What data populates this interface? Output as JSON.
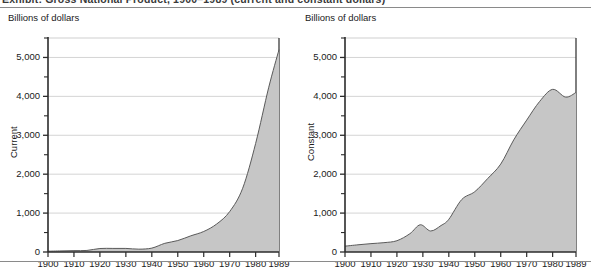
{
  "figure": {
    "title_clipped": "Exhibit: Gross National Product, 1900–1989 (current and constant dollars)",
    "colors": {
      "area_fill": "#c6c6c6",
      "area_line": "#5a5a5a",
      "axis": "#2b2b2b",
      "gridline": "#c9c9c9",
      "rule": "#8a8a8a",
      "text": "#1a1a1a"
    }
  },
  "panels": [
    {
      "id": "current",
      "unit_label": "Billions of dollars",
      "axis_title": "Current"
    },
    {
      "id": "constant",
      "unit_label": "Billions of dollars",
      "axis_title": "Constant"
    }
  ],
  "y_tick_labels": [
    "5,000",
    "4,000",
    "3,000",
    "2,000",
    "1,000",
    "0"
  ],
  "x_tick_labels": [
    "1900",
    "1910",
    "1920",
    "1930",
    "1940",
    "1950",
    "1960",
    "1970",
    "1980",
    "1989"
  ],
  "chart_data": [
    {
      "type": "area",
      "id": "current",
      "title": "Current",
      "xlabel": "",
      "ylabel": "Current",
      "unit": "Billions of dollars",
      "xlim": [
        1900,
        1989
      ],
      "ylim": [
        0,
        5500
      ],
      "yticks": [
        0,
        1000,
        2000,
        3000,
        4000,
        5000
      ],
      "yticks_minor": [
        500,
        1500,
        2500,
        3500,
        4500,
        5500
      ],
      "xticks": [
        1900,
        1910,
        1920,
        1930,
        1940,
        1950,
        1960,
        1970,
        1980,
        1989
      ],
      "grid": "horizontal",
      "legend": "none",
      "x": [
        1900,
        1905,
        1910,
        1915,
        1920,
        1925,
        1930,
        1935,
        1940,
        1945,
        1950,
        1955,
        1960,
        1965,
        1970,
        1975,
        1980,
        1985,
        1989
      ],
      "values": [
        20,
        28,
        35,
        40,
        90,
        92,
        92,
        73,
        100,
        223,
        294,
        415,
        527,
        720,
        1039,
        1638,
        2790,
        4220,
        5200
      ]
    },
    {
      "type": "area",
      "id": "constant",
      "title": "Constant",
      "xlabel": "",
      "ylabel": "Constant",
      "unit": "Billions of dollars",
      "xlim": [
        1900,
        1989
      ],
      "ylim": [
        0,
        5500
      ],
      "yticks": [
        0,
        1000,
        2000,
        3000,
        4000,
        5000
      ],
      "yticks_minor": [
        500,
        1500,
        2500,
        3500,
        4500,
        5500
      ],
      "xticks": [
        1900,
        1910,
        1920,
        1930,
        1940,
        1950,
        1960,
        1970,
        1980,
        1989
      ],
      "grid": "horizontal",
      "legend": "none",
      "x": [
        1900,
        1905,
        1910,
        1915,
        1920,
        1925,
        1929,
        1933,
        1937,
        1940,
        1945,
        1950,
        1955,
        1960,
        1965,
        1970,
        1975,
        1980,
        1985,
        1989
      ],
      "values": [
        150,
        185,
        215,
        240,
        290,
        470,
        700,
        540,
        680,
        840,
        1350,
        1550,
        1890,
        2260,
        2880,
        3390,
        3870,
        4180,
        3980,
        4100
      ]
    }
  ]
}
